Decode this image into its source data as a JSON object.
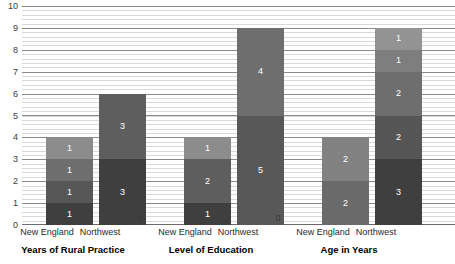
{
  "chart_data": {
    "type": "bar",
    "title": "",
    "xlabel": "",
    "ylabel": "",
    "ylim": [
      0,
      10
    ],
    "grid": true,
    "legend": "none",
    "stacked": true,
    "yticks": [
      "10",
      "9",
      "8",
      "7",
      "6",
      "5",
      "4",
      "3",
      "2",
      "1",
      "0"
    ],
    "groups": [
      {
        "name": "Years of Rural Practice",
        "bars": [
          {
            "category": "New England",
            "total": 4,
            "segments": [
              {
                "value": 1,
                "label": "1",
                "color": "#3f3f3f"
              },
              {
                "value": 1,
                "label": "1",
                "color": "#575757"
              },
              {
                "value": 1,
                "label": "1",
                "color": "#6e6e6e"
              },
              {
                "value": 1,
                "label": "1",
                "color": "#8c8c8c"
              }
            ]
          },
          {
            "category": "Northwest",
            "total": 6,
            "segments": [
              {
                "value": 3,
                "label": "3",
                "color": "#3f3f3f"
              },
              {
                "value": 3,
                "label": "3",
                "color": "#5e5e5e"
              }
            ]
          }
        ]
      },
      {
        "name": "Level of Education",
        "bars": [
          {
            "category": "New England",
            "total": 4,
            "segments": [
              {
                "value": 1,
                "label": "1",
                "color": "#3f3f3f"
              },
              {
                "value": 2,
                "label": "2",
                "color": "#5e5e5e"
              },
              {
                "value": 1,
                "label": "1",
                "color": "#8c8c8c"
              }
            ]
          },
          {
            "category": "Northwest",
            "total": 9,
            "segments": [
              {
                "value": 5,
                "label": "5",
                "color": "#585858"
              },
              {
                "value": 4,
                "label": "4",
                "color": "#6e6e6e"
              }
            ]
          }
        ]
      },
      {
        "name": "Age in Years",
        "bars": [
          {
            "category": "New England",
            "total": 4,
            "segments": [
              {
                "value": 2,
                "label": "2",
                "color": "#6a6a6a"
              },
              {
                "value": 2,
                "label": "2",
                "color": "#828282"
              }
            ]
          },
          {
            "category": "Northwest",
            "total": 9,
            "segments": [
              {
                "value": 3,
                "label": "3",
                "color": "#3f3f3f"
              },
              {
                "value": 2,
                "label": "2",
                "color": "#565656"
              },
              {
                "value": 2,
                "label": "2",
                "color": "#6e6e6e"
              },
              {
                "value": 1,
                "label": "1",
                "color": "#7e7e7e"
              },
              {
                "value": 1,
                "label": "1",
                "color": "#939393"
              }
            ]
          }
        ]
      }
    ],
    "zero_markers": [
      {
        "label": "0",
        "after_group": 0
      },
      {
        "label": "0",
        "after_group": 1
      }
    ]
  },
  "layout": {
    "bar_width_px": 47,
    "plot_height_px": 219,
    "bar_x_positions": [
      24,
      77,
      162,
      215,
      300,
      353
    ],
    "zero_x_positions": [
      140,
      278
    ],
    "zero_y_px": 212,
    "cat_label_x_positions": [
      47,
      100,
      185,
      238,
      323,
      376
    ],
    "group_title_x_positions": [
      73,
      211,
      349
    ]
  }
}
